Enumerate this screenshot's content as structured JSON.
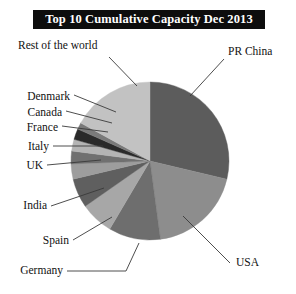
{
  "title": "Top 10 Cumulative Capacity Dec 2013",
  "colors": {
    "background": "#ffffff",
    "title_bar": "#0d0d0d",
    "title_text": "#ffffff",
    "label_text": "#111111",
    "leader_line": "#3a3a3a"
  },
  "chart_data": {
    "type": "pie",
    "title": "Top 10 Cumulative Capacity Dec 2013",
    "xlabel": "",
    "ylabel": "",
    "legend_position": "none",
    "labels_position": "callout-leader-lines",
    "grid": false,
    "categories": [
      "PR China",
      "USA",
      "Germany",
      "Spain",
      "India",
      "UK",
      "Italy",
      "France",
      "Canada",
      "Denmark",
      "Rest of the world"
    ],
    "values": [
      28.7,
      19.2,
      10.6,
      6.8,
      6.0,
      3.1,
      2.6,
      2.4,
      2.2,
      1.4,
      17.0
    ],
    "units": "percent of cumulative installed capacity",
    "slices": [
      {
        "label": "PR China",
        "value": 28.7,
        "start_angle": 0,
        "end_angle": 103.3,
        "color": "#5c5c5c"
      },
      {
        "label": "USA",
        "value": 19.2,
        "start_angle": 103.3,
        "end_angle": 172.4,
        "color": "#8d8d8d"
      },
      {
        "label": "Germany",
        "value": 10.6,
        "start_angle": 172.4,
        "end_angle": 210.6,
        "color": "#6e6e6e"
      },
      {
        "label": "Spain",
        "value": 6.8,
        "start_angle": 210.6,
        "end_angle": 235.1,
        "color": "#a7a7a7"
      },
      {
        "label": "India",
        "value": 6.0,
        "start_angle": 235.1,
        "end_angle": 256.7,
        "color": "#5f5f5f"
      },
      {
        "label": "UK",
        "value": 3.1,
        "start_angle": 256.7,
        "end_angle": 267.9,
        "color": "#9d9d9d"
      },
      {
        "label": "Italy",
        "value": 2.6,
        "start_angle": 267.9,
        "end_angle": 277.3,
        "color": "#707070"
      },
      {
        "label": "France",
        "value": 2.4,
        "start_angle": 277.3,
        "end_angle": 285.9,
        "color": "#b4b4b4"
      },
      {
        "label": "Canada",
        "value": 2.2,
        "start_angle": 285.9,
        "end_angle": 293.8,
        "color": "#2a2a2a"
      },
      {
        "label": "Denmark",
        "value": 1.4,
        "start_angle": 293.8,
        "end_angle": 298.8,
        "color": "#7a7a7a"
      },
      {
        "label": "Rest of the world",
        "value": 17.0,
        "start_angle": 298.8,
        "end_angle": 360,
        "color": "#c2c2c2"
      }
    ]
  },
  "labels": {
    "rest_of_the_world": "Rest of the world",
    "denmark": "Denmark",
    "canada": "Canada",
    "france": "France",
    "italy": "Italy",
    "uk": "UK",
    "india": "India",
    "spain": "Spain",
    "germany": "Germany",
    "pr_china": "PR China",
    "usa": "USA"
  }
}
